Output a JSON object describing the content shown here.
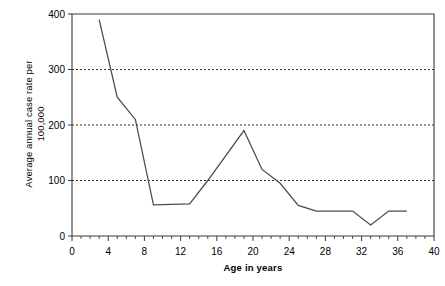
{
  "chart_data": {
    "type": "line",
    "title": "",
    "xlabel": "Age in years",
    "ylabel": "Average annual case rate per 100,000",
    "ylabel_lines": [
      "Average annual case rate per",
      "100,000"
    ],
    "xlim": [
      0,
      40
    ],
    "ylim": [
      0,
      400
    ],
    "xticks": [
      0,
      4,
      8,
      12,
      16,
      20,
      24,
      28,
      32,
      36,
      40
    ],
    "xtick_labels": [
      "0",
      "4",
      "8",
      "12",
      "16",
      "20",
      "24",
      "28",
      "32",
      "36",
      "40"
    ],
    "xminor_tick_step": 1,
    "yticks": [
      0,
      100,
      200,
      300,
      400
    ],
    "ytick_labels": [
      "0",
      "100",
      "200",
      "300",
      "400"
    ],
    "grid": "horizontal-dotted-at-100-200-300",
    "legend": "none",
    "series": [
      {
        "name": "Average annual case rate",
        "color": "#4a4a4a",
        "x": [
          3,
          5,
          7,
          9,
          13,
          15,
          19,
          21,
          23,
          25,
          27,
          31,
          33,
          35,
          37
        ],
        "values": [
          390,
          250,
          210,
          56,
          58,
          100,
          190,
          120,
          95,
          55,
          45,
          45,
          20,
          45,
          45
        ]
      }
    ]
  }
}
